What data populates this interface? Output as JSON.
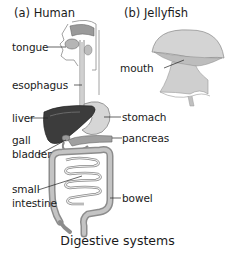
{
  "caption": "Digestive systems",
  "panels": {
    "human": {
      "title": "(a) Human",
      "labels": {
        "tongue": "tongue",
        "esophagus": "esophagus",
        "liver": "liver",
        "gall_bladder_1": "gall",
        "gall_bladder_2": "bladder",
        "small_intestine_1": "small",
        "small_intestine_2": "intestine",
        "stomach": "stomach",
        "pancreas": "pancreas",
        "bowel": "bowel"
      }
    },
    "jellyfish": {
      "title": "(b) Jellyfish",
      "labels": {
        "mouth": "mouth"
      }
    }
  },
  "colors": {
    "liver": "#3a3a3a",
    "organ_light": "#d9d9d9",
    "organ_mid": "#a8a8a8",
    "outline": "#555555",
    "jellyfish": "#c8c8c8"
  }
}
